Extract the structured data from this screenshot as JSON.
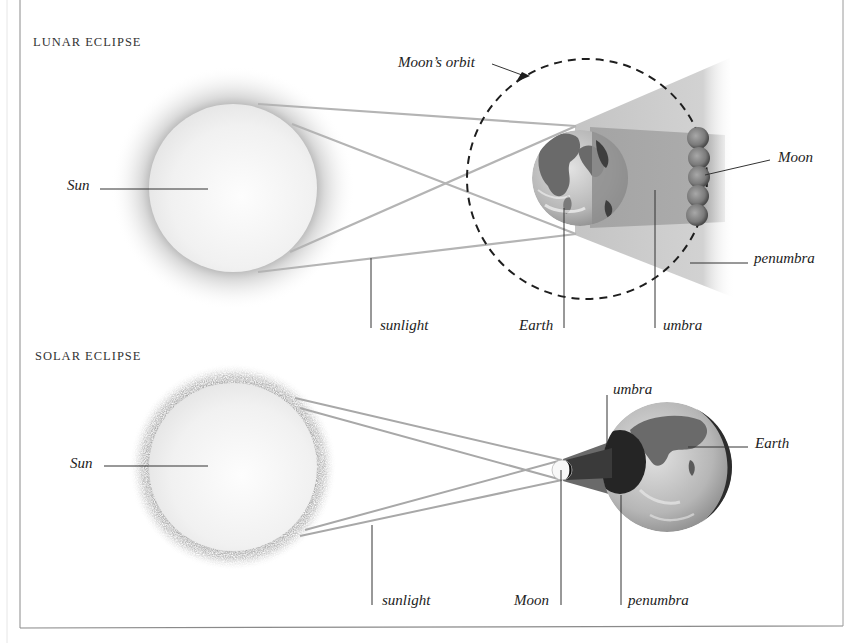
{
  "lunar": {
    "title": "LUNAR ECLIPSE",
    "labels": {
      "sun": "Sun",
      "moons_orbit": "Moon’s orbit",
      "moon": "Moon",
      "penumbra": "penumbra",
      "sunlight": "sunlight",
      "earth": "Earth",
      "umbra": "umbra"
    }
  },
  "solar": {
    "title": "SOLAR ECLIPSE",
    "labels": {
      "sun": "Sun",
      "umbra": "umbra",
      "earth": "Earth",
      "sunlight": "sunlight",
      "moon": "Moon",
      "penumbra": "penumbra"
    }
  },
  "colors": {
    "frame": "#8a8a8a",
    "sun_fill": "#f3f3f3",
    "sun_glow": "#9a9a9a",
    "ray": "#b0b0b0",
    "leader": "#333333",
    "orbit": "#222222",
    "penumbra": "#c8c8c8",
    "umbra": "#a8a8a8",
    "earth_ocean": "#bdbdbd",
    "earth_land": "#6e6e6e",
    "moon_lunar": "#8a8a8a"
  }
}
